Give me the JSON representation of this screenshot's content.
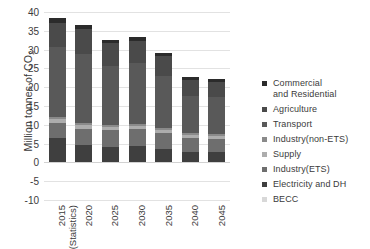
{
  "chart_data": {
    "type": "bar",
    "stacked": true,
    "title": "",
    "xlabel": "",
    "ylabel": "Million tonnes of CO2",
    "ylabel_display": "Million tonnes of CO",
    "ylabel_subscript": "2",
    "ylim": [
      -10,
      40
    ],
    "ytick_step": 5,
    "ytick_labels": [
      "40",
      "35",
      "30",
      "25",
      "20",
      "15",
      "10",
      "5",
      "0",
      "-5",
      "-10"
    ],
    "ytick_values": [
      40,
      35,
      30,
      25,
      20,
      15,
      10,
      5,
      0,
      -5,
      -10
    ],
    "grid": true,
    "legend_position": "right",
    "categories": [
      "2015 (Statistics)",
      "2020",
      "2025",
      "2030",
      "2035",
      "2040",
      "2045"
    ],
    "category_lines": [
      [
        "2015",
        "(Statistics)"
      ],
      [
        "2020"
      ],
      [
        "2025"
      ],
      [
        "2030"
      ],
      [
        "2035"
      ],
      [
        "2040"
      ],
      [
        "2045"
      ]
    ],
    "series": [
      {
        "name": "BECC",
        "color": "#d8d8d8",
        "values": [
          0,
          0,
          0,
          0,
          0,
          0,
          0
        ]
      },
      {
        "name": "Electricity and DH",
        "color": "#3f3f3f",
        "values": [
          6.5,
          4.6,
          4.2,
          4.4,
          3.6,
          2.9,
          2.7
        ]
      },
      {
        "name": "Industry(ETS)",
        "color": "#6e6e6e",
        "values": [
          4.0,
          4.4,
          4.3,
          4.4,
          4.2,
          3.7,
          3.6
        ]
      },
      {
        "name": "Supply",
        "color": "#adadad",
        "values": [
          1.0,
          1.0,
          0.9,
          0.9,
          0.9,
          0.8,
          0.8
        ]
      },
      {
        "name": "Industry(non-ETS)",
        "color": "#8a8a8a",
        "values": [
          0.6,
          0.6,
          0.5,
          0.5,
          0.5,
          0.4,
          0.4
        ]
      },
      {
        "name": "Transport",
        "color": "#595959",
        "values": [
          18.5,
          18.2,
          15.8,
          16.2,
          13.8,
          10.0,
          9.9
        ]
      },
      {
        "name": "Agriculture",
        "color": "#4a4a4a",
        "values": [
          6.5,
          6.6,
          6.0,
          5.9,
          5.2,
          4.0,
          4.0
        ]
      },
      {
        "name": "Commercial and Residential",
        "color": "#2b2b2b",
        "values": [
          1.2,
          1.1,
          1.0,
          1.0,
          1.0,
          0.8,
          0.8
        ]
      }
    ],
    "totals": [
      38.3,
      36.5,
      32.7,
      33.3,
      29.2,
      22.6,
      22.2
    ]
  },
  "legend": {
    "items": [
      {
        "label": "Commercial and Residential",
        "lines": [
          "Commercial",
          "and Residential"
        ],
        "color": "#2b2b2b"
      },
      {
        "label": "Agriculture",
        "lines": [
          "Agriculture"
        ],
        "color": "#4a4a4a"
      },
      {
        "label": "Transport",
        "lines": [
          "Transport"
        ],
        "color": "#595959"
      },
      {
        "label": "Industry(non-ETS)",
        "lines": [
          "Industry(non-ETS)"
        ],
        "color": "#8a8a8a"
      },
      {
        "label": "Supply",
        "lines": [
          "Supply"
        ],
        "color": "#adadad"
      },
      {
        "label": "Industry(ETS)",
        "lines": [
          "Industry(ETS)"
        ],
        "color": "#6e6e6e"
      },
      {
        "label": "Electricity and DH",
        "lines": [
          "Electricity and DH"
        ],
        "color": "#3f3f3f"
      },
      {
        "label": "BECC",
        "lines": [
          "BECC"
        ],
        "color": "#d8d8d8"
      }
    ]
  },
  "colors": {
    "background": "#ffffff",
    "text": "#3b3b3b",
    "gridline": "#e2e2e2"
  }
}
